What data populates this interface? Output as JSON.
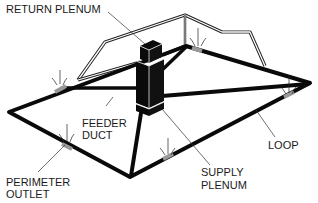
{
  "diagram": {
    "type": "perimeter-loop-duct-system",
    "colors": {
      "line": "#0a0a0a",
      "outline": "#222222",
      "outlet": "#888888",
      "background": "#ffffff"
    },
    "labels": {
      "return_plenum": "RETURN PLENUM",
      "feeder_duct_line1": "FEEDER",
      "feeder_duct_line2": "DUCT",
      "supply_plenum_line1": "SUPPLY",
      "supply_plenum_line2": "PLENUM",
      "loop": "LOOP",
      "perimeter_outlet_line1": "PERIMETER",
      "perimeter_outlet_line2": "OUTLET"
    }
  }
}
